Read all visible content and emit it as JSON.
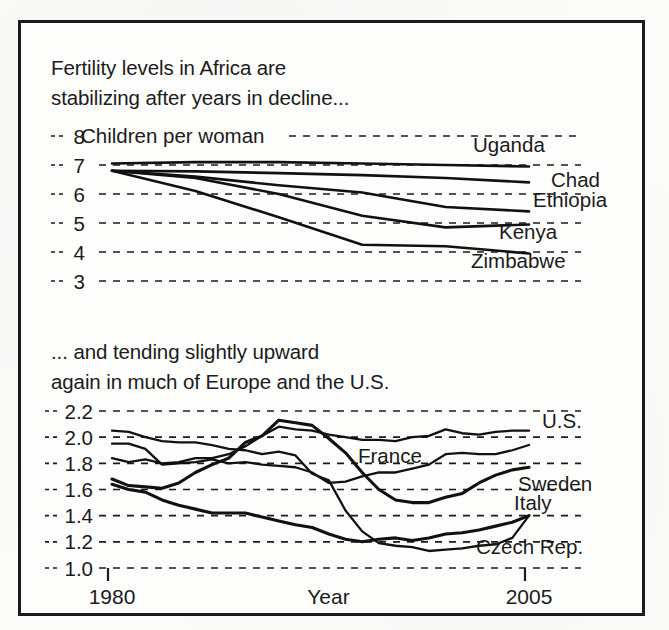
{
  "figure": {
    "frame_border_color": "#1b1b1b",
    "background_color": "#fdfdfc",
    "line_color": "#111111"
  },
  "top_caption_line1": "Fertility levels in Africa are",
  "top_caption_line2": "stabilizing after years in decline...",
  "bottom_caption_line1": "... and tending slightly upward",
  "bottom_caption_line2": "again in much of Europe and the U.S.",
  "axis": {
    "x_label": "Year",
    "x_tick_start": "1980",
    "x_tick_end": "2005",
    "top_y_unit_note": "Children per woman"
  },
  "labels": {
    "t0": "8",
    "t1": "7",
    "t2": "6",
    "t3": "5",
    "t4": "4",
    "t5": "3",
    "b0": "2.2",
    "b1": "2.0",
    "b2": "1.8",
    "b3": "1.6",
    "b4": "1.4",
    "b5": "1.2",
    "b6": "1.0",
    "s_uganda": "Uganda",
    "s_chad": "Chad",
    "s_ethiopia": "Ethiopia",
    "s_kenya": "Kenya",
    "s_zimbabwe": "Zimbabwe",
    "s_us": "U.S.",
    "s_france": "France",
    "s_sweden": "Sweden",
    "s_italy": "Italy",
    "s_czech": "Czech Rep."
  },
  "chart_data": [
    {
      "type": "line",
      "title": "Fertility levels in Africa are stabilizing after years in decline...",
      "xlabel": "Year",
      "ylabel": "Children per woman",
      "xlim": [
        1980,
        2005
      ],
      "ylim": [
        3,
        8
      ],
      "yticks": [
        3,
        4,
        5,
        6,
        7,
        8
      ],
      "grid": true,
      "legend_position": "right-inline-labels",
      "x": [
        1980,
        1985,
        1990,
        1995,
        2000,
        2005
      ],
      "series": [
        {
          "name": "Uganda",
          "values": [
            7.05,
            7.1,
            7.1,
            7.05,
            7.0,
            6.95
          ]
        },
        {
          "name": "Chad",
          "values": [
            6.8,
            6.78,
            6.72,
            6.65,
            6.55,
            6.4
          ]
        },
        {
          "name": "Ethiopia",
          "values": [
            6.8,
            6.6,
            6.3,
            6.05,
            5.55,
            5.4
          ]
        },
        {
          "name": "Kenya",
          "values": [
            6.8,
            6.55,
            6.0,
            5.25,
            4.85,
            4.95
          ]
        },
        {
          "name": "Zimbabwe",
          "values": [
            6.8,
            6.1,
            5.2,
            4.25,
            4.2,
            3.95
          ]
        }
      ]
    },
    {
      "type": "line",
      "title": "... and tending slightly upward again in much of Europe and the U.S.",
      "xlabel": "Year",
      "ylabel": "Children per woman",
      "xlim": [
        1980,
        2005
      ],
      "ylim": [
        1.0,
        2.2
      ],
      "yticks": [
        1.0,
        1.2,
        1.4,
        1.6,
        1.8,
        2.0,
        2.2
      ],
      "grid": true,
      "legend_position": "right-inline-labels",
      "x": [
        1980,
        1981,
        1982,
        1983,
        1984,
        1985,
        1986,
        1987,
        1988,
        1989,
        1990,
        1991,
        1992,
        1993,
        1994,
        1995,
        1996,
        1997,
        1998,
        1999,
        2000,
        2001,
        2002,
        2003,
        2004,
        2005
      ],
      "series": [
        {
          "name": "U.S.",
          "values": [
            1.84,
            1.81,
            1.83,
            1.8,
            1.81,
            1.84,
            1.84,
            1.87,
            1.93,
            2.01,
            2.08,
            2.06,
            2.05,
            2.02,
            2.0,
            1.98,
            1.98,
            1.97,
            2.0,
            2.01,
            2.06,
            2.03,
            2.02,
            2.04,
            2.05,
            2.05
          ]
        },
        {
          "name": "France",
          "values": [
            1.95,
            1.95,
            1.91,
            1.79,
            1.8,
            1.81,
            1.83,
            1.8,
            1.81,
            1.79,
            1.78,
            1.77,
            1.73,
            1.65,
            1.66,
            1.7,
            1.73,
            1.73,
            1.76,
            1.79,
            1.87,
            1.88,
            1.87,
            1.87,
            1.9,
            1.94
          ]
        },
        {
          "name": "Sweden",
          "values": [
            1.68,
            1.63,
            1.62,
            1.61,
            1.65,
            1.73,
            1.79,
            1.84,
            1.96,
            2.01,
            2.13,
            2.11,
            2.09,
            1.99,
            1.88,
            1.73,
            1.6,
            1.52,
            1.5,
            1.5,
            1.54,
            1.57,
            1.65,
            1.71,
            1.75,
            1.77
          ]
        },
        {
          "name": "Italy",
          "values": [
            1.64,
            1.6,
            1.58,
            1.52,
            1.48,
            1.45,
            1.42,
            1.42,
            1.42,
            1.39,
            1.36,
            1.33,
            1.31,
            1.26,
            1.22,
            1.2,
            1.22,
            1.23,
            1.21,
            1.23,
            1.26,
            1.27,
            1.29,
            1.32,
            1.35,
            1.4
          ]
        },
        {
          "name": "Czech Rep.",
          "values": [
            2.05,
            2.04,
            2.0,
            1.97,
            1.96,
            1.96,
            1.94,
            1.91,
            1.9,
            1.87,
            1.89,
            1.86,
            1.72,
            1.67,
            1.44,
            1.28,
            1.19,
            1.17,
            1.16,
            1.13,
            1.14,
            1.15,
            1.17,
            1.18,
            1.23,
            1.4
          ]
        }
      ]
    }
  ]
}
